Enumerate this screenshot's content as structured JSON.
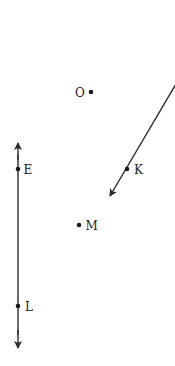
{
  "diagram": {
    "colors": {
      "stroke": "#2a2a2a",
      "text": "#222222",
      "background": "#ffffff"
    },
    "lines": [
      {
        "id": "vertical-line",
        "type": "line-double-arrow",
        "x1": 18,
        "y1": 142,
        "x2": 18,
        "y2": 348,
        "through": [
          "E",
          "L"
        ]
      },
      {
        "id": "diagonal-ray",
        "type": "ray",
        "x1": 175,
        "y1": 86,
        "x2": 110,
        "y2": 196,
        "through": [
          "K"
        ]
      }
    ],
    "points": [
      {
        "label": "O",
        "x": 91,
        "y": 92,
        "label_side": "left"
      },
      {
        "label": "E",
        "x": 18,
        "y": 169,
        "label_side": "right"
      },
      {
        "label": "K",
        "x": 127,
        "y": 169,
        "label_side": "right"
      },
      {
        "label": "M",
        "x": 79,
        "y": 225,
        "label_side": "right"
      },
      {
        "label": "L",
        "x": 18,
        "y": 306,
        "label_side": "right"
      }
    ]
  }
}
